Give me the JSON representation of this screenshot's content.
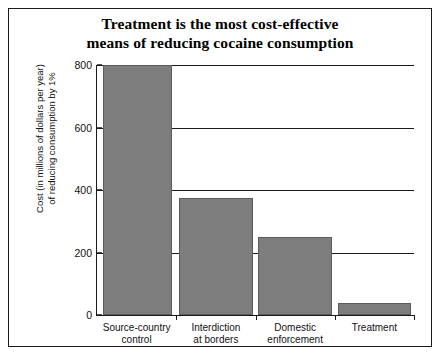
{
  "chart_data": {
    "type": "bar",
    "title": "Treatment is the most cost-effective means of reducing cocaine consumption",
    "title_lines": [
      "Treatment is the most cost-effective",
      "means of reducing cocaine consumption"
    ],
    "xlabel": "",
    "ylabel": "Cost (in millions of dollars per year) of reducing consumption by 1%",
    "ylabel_lines": [
      "Cost (in millions of dollars per year)",
      "of reducing consumption by 1%"
    ],
    "categories": [
      "Source-country control",
      "Interdiction at borders",
      "Domestic enforcement",
      "Treatment"
    ],
    "category_lines": [
      [
        "Source-country",
        "control"
      ],
      [
        "Interdiction",
        "at borders"
      ],
      [
        "Domestic",
        "enforcement"
      ],
      [
        "Treatment",
        ""
      ]
    ],
    "values": [
      800,
      375,
      250,
      40
    ],
    "ylim": [
      0,
      800
    ],
    "yticks": [
      0,
      200,
      400,
      600,
      800
    ],
    "ytick_labels": [
      "0",
      "200",
      "400",
      "600",
      "800"
    ],
    "grid": true,
    "legend": null,
    "bar_color": "#7d7d7d",
    "bar_edge_color": "#5c5c5c",
    "axis_color": "#1a1a1a",
    "background_color": "#ffffff"
  }
}
